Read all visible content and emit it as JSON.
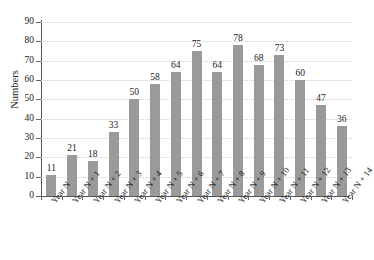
{
  "chart_data": {
    "type": "bar",
    "title": "",
    "xlabel": "",
    "ylabel": "Numbers",
    "ylim": [
      0,
      90
    ],
    "ytick_step": 10,
    "yticks": [
      0,
      10,
      20,
      30,
      40,
      50,
      60,
      70,
      80,
      90
    ],
    "grid": true,
    "legend": "none",
    "bar_color": "#9a9a9a",
    "categories": [
      "Year N",
      "Year N + 1",
      "Year N + 2",
      "Year N + 3",
      "Year N + 4",
      "Year N + 5",
      "Year N + 6",
      "Year N + 7",
      "Year N + 8",
      "Year N + 9",
      "Year N + 10",
      "Year N + 11",
      "Year N + 12",
      "Year N + 13",
      "Year N + 14"
    ],
    "values": [
      11,
      21,
      18,
      33,
      50,
      58,
      64,
      75,
      64,
      78,
      68,
      73,
      60,
      47,
      36
    ],
    "data_labels": [
      "11",
      "21",
      "18",
      "33",
      "50",
      "58",
      "64",
      "75",
      "64",
      "78",
      "68",
      "73",
      "60",
      "47",
      "36"
    ]
  }
}
